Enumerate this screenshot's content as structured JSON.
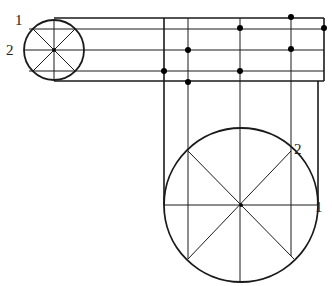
{
  "diagram": {
    "type": "orthographic-projection-construction",
    "colors": {
      "line": "#1a1a1a",
      "background": "#ffffff",
      "dot": "#000000"
    },
    "small_circle": {
      "cx": 54,
      "cy": 50,
      "r": 30,
      "labels": [
        {
          "text": "1",
          "x": 15,
          "y": 25
        },
        {
          "text": "2",
          "x": 6,
          "y": 55
        }
      ]
    },
    "large_circle": {
      "cx": 241,
      "cy": 205,
      "r": 77,
      "labels": [
        {
          "text": "2",
          "x": 294,
          "y": 154
        },
        {
          "text": "1",
          "x": 315,
          "y": 212
        }
      ]
    },
    "horizontal_lines_y": [
      18,
      29,
      50,
      71,
      81
    ],
    "vertical_lines_x": [
      164,
      188,
      240,
      291,
      324
    ],
    "dots": [
      {
        "x": 291,
        "y": 17
      },
      {
        "x": 324,
        "y": 28
      },
      {
        "x": 240,
        "y": 28
      },
      {
        "x": 188,
        "y": 50
      },
      {
        "x": 291,
        "y": 49
      },
      {
        "x": 164,
        "y": 71
      },
      {
        "x": 240,
        "y": 71
      },
      {
        "x": 188,
        "y": 82
      }
    ]
  }
}
